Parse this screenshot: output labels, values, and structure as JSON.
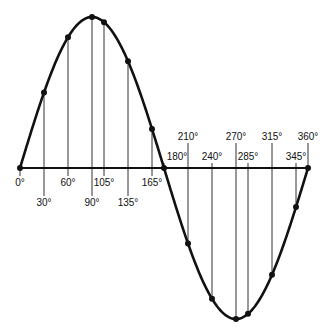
{
  "diagram": {
    "type": "sine-wave",
    "colors": {
      "curve": "#111111",
      "axis": "#111111",
      "gridline": "#333333",
      "background": "#ffffff"
    },
    "layout": {
      "x_origin_px": 20,
      "x_end_px": 308,
      "axis_y_px": 168,
      "amplitude_px": 151
    },
    "points": [
      {
        "deg": 0,
        "label": "0°",
        "label_row": "below1"
      },
      {
        "deg": 30,
        "label": "30°",
        "label_row": "below2"
      },
      {
        "deg": 60,
        "label": "60°",
        "label_row": "below1"
      },
      {
        "deg": 90,
        "label": "90°",
        "label_row": "below2"
      },
      {
        "deg": 105,
        "label": "105°",
        "label_row": "below1"
      },
      {
        "deg": 135,
        "label": "135°",
        "label_row": "below2"
      },
      {
        "deg": 165,
        "label": "165°",
        "label_row": "below1"
      },
      {
        "deg": 180,
        "label": "180°",
        "label_row": "above1"
      },
      {
        "deg": 210,
        "label": "210°",
        "label_row": "above2"
      },
      {
        "deg": 240,
        "label": "240°",
        "label_row": "above1"
      },
      {
        "deg": 270,
        "label": "270°",
        "label_row": "above2"
      },
      {
        "deg": 285,
        "label": "285°",
        "label_row": "above1"
      },
      {
        "deg": 315,
        "label": "315°",
        "label_row": "above2"
      },
      {
        "deg": 345,
        "label": "345°",
        "label_row": "above1"
      },
      {
        "deg": 360,
        "label": "360°",
        "label_row": "above2"
      }
    ]
  }
}
